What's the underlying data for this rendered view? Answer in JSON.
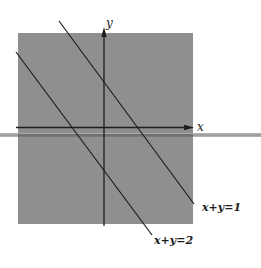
{
  "diagram": {
    "colors": {
      "background": "#ffffff",
      "region": "#8f8f8f",
      "ink": "#1e1e1e",
      "stray_line": "#9a9a9a"
    },
    "axes": {
      "x_label": "x",
      "y_label": "y"
    },
    "lines": [
      {
        "id": "line-1",
        "equation": "x + y = 1",
        "label": "x+y=1"
      },
      {
        "id": "line-2",
        "equation": "x + y = 2",
        "label": "x+y=2"
      }
    ]
  }
}
